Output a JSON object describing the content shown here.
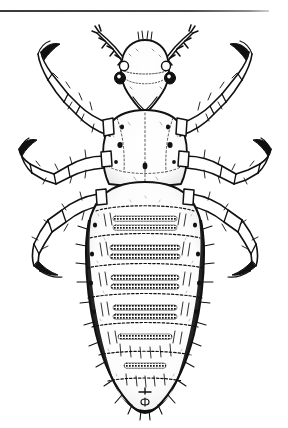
{
  "page": {
    "background_color": "#ffffff",
    "ink_color": "#111111",
    "width": 288,
    "height": 428
  },
  "top_rule": {
    "present": true,
    "color": "#3a3a3a",
    "x_start": 0,
    "x_end": 269,
    "y": 10,
    "thickness": 2
  },
  "figure": {
    "view": "dorsal",
    "style": "pen-and-ink scientific line illustration, stippled shading",
    "orientation": "head at top, abdomen at bottom",
    "parts": {
      "antennae": {
        "count": 2,
        "segments": 5,
        "setae": "true"
      },
      "eyes": {
        "count": 2,
        "description": "dark round ocular points lateral to head"
      },
      "head": {
        "shape": "elongate oval, pointed rostrum",
        "position": "top center"
      },
      "thorax": {
        "description": "fused, bearing three pairs of legs, with paired dark spots"
      },
      "legs": {
        "count": 6,
        "pairs": 3,
        "claws": "large curved tarsal claws on each leg"
      },
      "abdomen": {
        "segments": 8,
        "description": "broad oval, segmented with transverse dark stippled bands and paired spiracles"
      }
    }
  }
}
